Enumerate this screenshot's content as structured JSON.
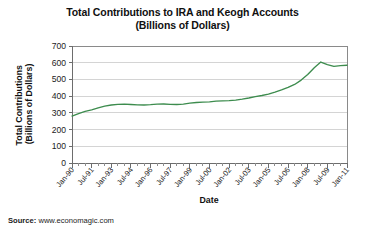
{
  "title": {
    "line1": "Total Contributions to IRA and Keogh Accounts",
    "line2": "(Billions of Dollars)"
  },
  "source": {
    "label": "Source:",
    "value": " www.economagic.com"
  },
  "colors": {
    "line": "#3d8c4e",
    "grid": "#d4d4d4",
    "axis": "#6d6d6d",
    "text": "#1c1c1c",
    "background": "#ffffff"
  },
  "chart_data": {
    "type": "line",
    "title": "Total Contributions to IRA and Keogh Accounts (Billions of Dollars)",
    "xlabel": "Date",
    "ylabel": "Total Contributions (Billions of Dollars)",
    "ylim": [
      0,
      700
    ],
    "yticks": [
      0,
      100,
      200,
      300,
      400,
      500,
      600,
      700
    ],
    "ytick_labels": [
      "0",
      "100",
      "200",
      "300",
      "400",
      "500",
      "600",
      "700"
    ],
    "xlim": [
      "Jan-90",
      "Jan-11"
    ],
    "xtick_labels": [
      "Jan-90",
      "Jul-91",
      "Jan-93",
      "Jul-94",
      "Jan-96",
      "Jul-97",
      "Jan-99",
      "Jul-00",
      "Jan-02",
      "Jul-03",
      "Jan-05",
      "Jul-06",
      "Jan-08",
      "Jul-09",
      "Jan-11"
    ],
    "grid": "horizontal",
    "legend": "none",
    "series": [
      {
        "name": "Total Contributions to IRA and Keogh Accounts",
        "color": "#3d8c4e",
        "x": [
          "Jan-90",
          "Jul-90",
          "Jan-91",
          "Jul-91",
          "Jan-92",
          "Jul-92",
          "Jan-93",
          "Jul-93",
          "Jan-94",
          "Jul-94",
          "Jan-95",
          "Jul-95",
          "Jan-96",
          "Jul-96",
          "Jan-97",
          "Jul-97",
          "Jan-98",
          "Jul-98",
          "Jan-99",
          "Jul-99",
          "Jan-00",
          "Jul-00",
          "Jan-01",
          "Jul-01",
          "Jan-02",
          "Jul-02",
          "Jan-03",
          "Jul-03",
          "Jan-04",
          "Jul-04",
          "Jan-05",
          "Jul-05",
          "Jan-06",
          "Jul-06",
          "Jan-07",
          "Jul-07",
          "Jan-08",
          "Jul-08",
          "Jan-09",
          "Jul-09",
          "Jan-10",
          "Jul-10",
          "Jan-11"
        ],
        "values": [
          281,
          296,
          309,
          318,
          330,
          340,
          347,
          351,
          352,
          350,
          348,
          347,
          349,
          352,
          353,
          351,
          350,
          352,
          358,
          362,
          364,
          366,
          370,
          372,
          373,
          376,
          382,
          389,
          397,
          404,
          412,
          424,
          437,
          452,
          470,
          496,
          530,
          570,
          604,
          588,
          578,
          583,
          585
        ]
      }
    ]
  }
}
